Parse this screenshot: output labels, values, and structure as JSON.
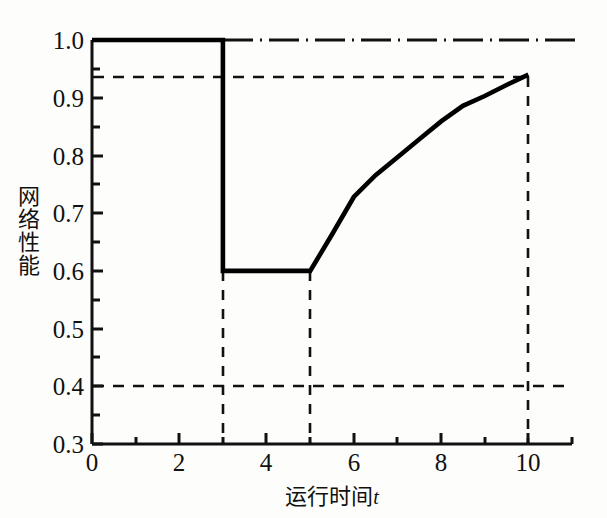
{
  "chart_data": {
    "type": "line",
    "title": "",
    "xlabel": "运行时间t",
    "xlabel_main": "运行时间",
    "xlabel_var": "t",
    "ylabel": "网络性能",
    "ylabel_chars": [
      "网",
      "络",
      "性",
      "能"
    ],
    "xlim": [
      0,
      11
    ],
    "ylim": [
      0.3,
      1.0
    ],
    "grid": false,
    "legend": null,
    "x_ticks": [
      0,
      2,
      4,
      6,
      8,
      10
    ],
    "x_tick_labels": [
      "0",
      "2",
      "4",
      "6",
      "8",
      "10"
    ],
    "x_minor_ticks": [
      1,
      3,
      5,
      7,
      9,
      11
    ],
    "y_ticks": [
      0.3,
      0.4,
      0.5,
      0.6,
      0.7,
      0.8,
      0.9,
      1.0
    ],
    "y_tick_labels": [
      "0.3",
      "0.4",
      "0.5",
      "0.6",
      "0.7",
      "0.8",
      "0.9",
      "1.0"
    ],
    "y_minor_ticks": [
      0.35,
      0.45,
      0.55,
      0.65,
      0.75,
      0.85,
      0.95
    ],
    "series": [
      {
        "name": "网络性能曲线",
        "style": "solid",
        "color": "#000000",
        "linewidth": 4,
        "points": [
          {
            "x": 0,
            "y": 1.0
          },
          {
            "x": 3,
            "y": 1.0
          },
          {
            "x": 3,
            "y": 0.6
          },
          {
            "x": 5,
            "y": 0.6
          },
          {
            "x": 5.5,
            "y": 0.663
          },
          {
            "x": 6,
            "y": 0.728
          },
          {
            "x": 6.5,
            "y": 0.766
          },
          {
            "x": 7,
            "y": 0.797
          },
          {
            "x": 7.5,
            "y": 0.828
          },
          {
            "x": 8,
            "y": 0.859
          },
          {
            "x": 8.5,
            "y": 0.886
          },
          {
            "x": 9,
            "y": 0.903
          },
          {
            "x": 9.5,
            "y": 0.922
          },
          {
            "x": 10,
            "y": 0.94
          }
        ]
      },
      {
        "name": "理想性能基准线",
        "style": "dashdot",
        "color": "#000000",
        "linewidth": 2,
        "points": [
          {
            "x": 3,
            "y": 1.0
          },
          {
            "x": 11,
            "y": 1.0
          }
        ]
      }
    ],
    "reference_lines": [
      {
        "name": "恢复性能水平",
        "orientation": "horizontal",
        "value": 0.94,
        "x_from": 0,
        "x_to": 10,
        "style": "dashed"
      },
      {
        "name": "性能下限",
        "orientation": "horizontal",
        "value": 0.4,
        "x_from": 0,
        "x_to": 11,
        "style": "dashed"
      },
      {
        "name": "故障发生时刻",
        "orientation": "vertical",
        "value": 3,
        "y_from": 0.3,
        "y_to": 0.6,
        "style": "dashed"
      },
      {
        "name": "恢复开始时刻",
        "orientation": "vertical",
        "value": 5,
        "y_from": 0.3,
        "y_to": 0.6,
        "style": "dashed"
      },
      {
        "name": "恢复完成时刻",
        "orientation": "vertical",
        "value": 10,
        "y_from": 0.3,
        "y_to": 0.94,
        "style": "dashed"
      }
    ],
    "annotations": [
      {
        "name": "故障前性能",
        "value": 1.0
      },
      {
        "name": "故障后性能",
        "value": 0.6
      },
      {
        "name": "恢复后性能",
        "value": 0.94
      }
    ]
  }
}
